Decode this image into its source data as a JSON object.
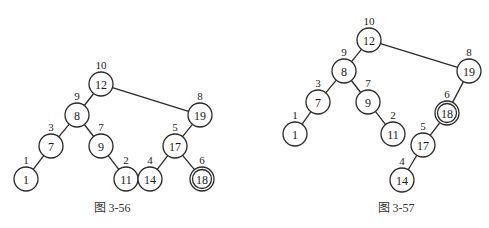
{
  "colors": {
    "stroke": "#2a2a2a",
    "text": "#1a1a1a",
    "background": "#ffffff"
  },
  "figures": [
    {
      "caption": "图  3-56",
      "caption_pos": [
        112,
        208
      ],
      "node_radius": 12,
      "nodes": [
        {
          "id": "12",
          "label": "10",
          "x": 101,
          "y": 84
        },
        {
          "id": "8",
          "label": "9",
          "x": 77,
          "y": 115
        },
        {
          "id": "19",
          "label": "8",
          "x": 200,
          "y": 115
        },
        {
          "id": "7",
          "label": "3",
          "x": 51,
          "y": 146
        },
        {
          "id": "9",
          "label": "7",
          "x": 101,
          "y": 146
        },
        {
          "id": "17",
          "label": "5",
          "x": 175,
          "y": 146
        },
        {
          "id": "1",
          "label": "1",
          "x": 26,
          "y": 179
        },
        {
          "id": "11",
          "label": "2",
          "x": 126,
          "y": 179
        },
        {
          "id": "14",
          "label": "4",
          "x": 150,
          "y": 179
        },
        {
          "id": "18",
          "label": "6",
          "x": 202,
          "y": 179,
          "highlighted": true
        }
      ],
      "edges": [
        [
          "12",
          "8"
        ],
        [
          "12",
          "19"
        ],
        [
          "8",
          "7"
        ],
        [
          "8",
          "9"
        ],
        [
          "7",
          "1"
        ],
        [
          "9",
          "11"
        ],
        [
          "19",
          "17"
        ],
        [
          "17",
          "14"
        ],
        [
          "17",
          "18"
        ]
      ]
    },
    {
      "caption": "图  3-57",
      "caption_pos": [
        396,
        208
      ],
      "node_radius": 12,
      "nodes": [
        {
          "id": "12",
          "label": "10",
          "x": 369,
          "y": 40
        },
        {
          "id": "8",
          "label": "9",
          "x": 344,
          "y": 71
        },
        {
          "id": "19",
          "label": "8",
          "x": 469,
          "y": 71
        },
        {
          "id": "7",
          "label": "3",
          "x": 318,
          "y": 102
        },
        {
          "id": "9",
          "label": "7",
          "x": 368,
          "y": 102
        },
        {
          "id": "18",
          "label": "6",
          "x": 447,
          "y": 113,
          "highlighted": true
        },
        {
          "id": "1",
          "label": "1",
          "x": 295,
          "y": 134
        },
        {
          "id": "11",
          "label": "2",
          "x": 393,
          "y": 134
        },
        {
          "id": "17",
          "label": "5",
          "x": 423,
          "y": 145
        },
        {
          "id": "14",
          "label": "4",
          "x": 402,
          "y": 180
        }
      ],
      "edges": [
        [
          "12",
          "8"
        ],
        [
          "12",
          "19"
        ],
        [
          "8",
          "7"
        ],
        [
          "8",
          "9"
        ],
        [
          "7",
          "1"
        ],
        [
          "9",
          "11"
        ],
        [
          "19",
          "18"
        ],
        [
          "18",
          "17"
        ],
        [
          "17",
          "14"
        ]
      ]
    }
  ]
}
